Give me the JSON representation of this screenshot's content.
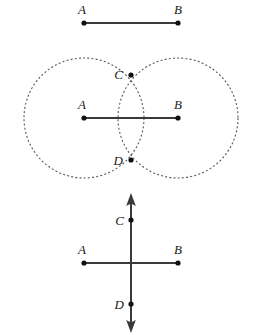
{
  "figure": {
    "width": 256,
    "height": 335,
    "background_color": "#ffffff",
    "stroke_color": "#3a3a3a",
    "dash_color": "#555555",
    "point_color": "#111111",
    "label_color": "#1a1a1a",
    "segment_stroke_width": 2,
    "dash_pattern": "2 2.2"
  },
  "panels": [
    {
      "id": "panel-1",
      "name": "given-segment",
      "caption": "",
      "segment": {
        "name": "segment-ab",
        "x1": 84,
        "y1": 23,
        "x2": 178,
        "y2": 23
      },
      "points": [
        {
          "id": "A",
          "label": "A",
          "x": 84,
          "y": 23,
          "label_x": 82,
          "label_y": 14,
          "anchor": "middle"
        },
        {
          "id": "B",
          "label": "B",
          "x": 178,
          "y": 23,
          "label_x": 178,
          "label_y": 14,
          "anchor": "middle"
        }
      ]
    },
    {
      "id": "panel-2",
      "name": "arc-intersection",
      "caption": "",
      "segment": {
        "name": "segment-ab",
        "x1": 84,
        "y1": 118,
        "x2": 178,
        "y2": 118
      },
      "circles": [
        {
          "id": "circle-a",
          "cx": 84,
          "cy": 118,
          "r": 60
        },
        {
          "id": "circle-b",
          "cx": 178,
          "cy": 118,
          "r": 60
        }
      ],
      "points": [
        {
          "id": "A",
          "label": "A",
          "x": 84,
          "y": 118,
          "label_x": 82,
          "label_y": 109,
          "anchor": "middle"
        },
        {
          "id": "B",
          "label": "B",
          "x": 178,
          "y": 118,
          "label_x": 178,
          "label_y": 109,
          "anchor": "middle"
        },
        {
          "id": "C",
          "label": "C",
          "x": 131,
          "y": 75,
          "label_x": 121,
          "label_y": 79,
          "anchor": "end"
        },
        {
          "id": "D",
          "label": "D",
          "x": 131,
          "y": 160,
          "label_x": 121,
          "label_y": 165,
          "anchor": "end"
        }
      ]
    },
    {
      "id": "panel-3",
      "name": "perpendicular-bisector-line",
      "caption": "",
      "segment": {
        "name": "segment-ab",
        "x1": 84,
        "y1": 263,
        "x2": 178,
        "y2": 263
      },
      "bisector": {
        "name": "bisector-line",
        "x": 131,
        "y_top": 196,
        "y_bottom": 330,
        "arrow_head_size": 6,
        "double_headed": true
      },
      "points": [
        {
          "id": "A",
          "label": "A",
          "x": 84,
          "y": 263,
          "label_x": 82,
          "label_y": 254,
          "anchor": "middle"
        },
        {
          "id": "B",
          "label": "B",
          "x": 178,
          "y": 263,
          "label_x": 178,
          "label_y": 254,
          "anchor": "middle"
        },
        {
          "id": "C",
          "label": "C",
          "x": 131,
          "y": 220,
          "label_x": 123,
          "label_y": 225,
          "anchor": "end"
        },
        {
          "id": "D",
          "label": "D",
          "x": 131,
          "y": 304,
          "label_x": 123,
          "label_y": 309,
          "anchor": "end"
        }
      ]
    }
  ],
  "point_radius": 2.6
}
